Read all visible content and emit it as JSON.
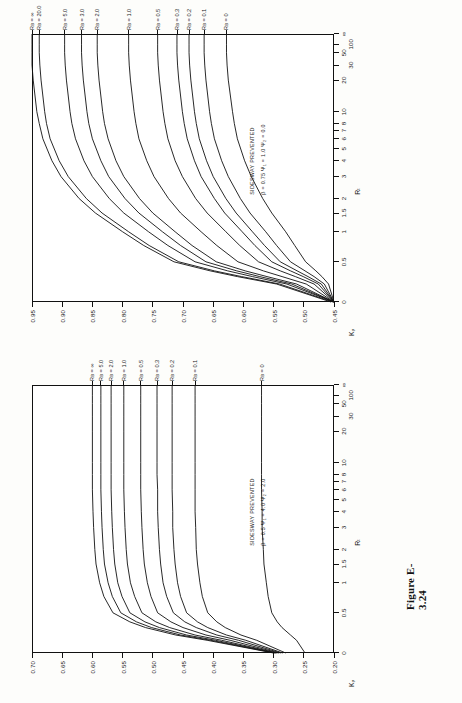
{
  "page": {
    "background": "#fdfdfb",
    "ink": "#111111"
  },
  "figures": [
    {
      "id": "figure-e-3-24",
      "caption": "Figure E-3.24",
      "position": "top",
      "annotation_line1": "SIDESWAY PREVENTED",
      "annotation_line2": "β = 0.75   Ψ₁ = 1.0    Ψ₂ = 0.0",
      "y_axis_title": "Kᵧ",
      "x_axis_title": "Rₜ",
      "y_ticks": [
        "0.45",
        "0.50",
        "0.55",
        "0.60",
        "0.65",
        "0.70",
        "0.75",
        "0.80",
        "0.85",
        "0.90",
        "0.95"
      ],
      "x_ticks": [
        "0",
        "0.5",
        "1",
        "1.5",
        "2",
        "3",
        "4",
        "5",
        "6",
        "7",
        "8",
        "10",
        "20",
        "30",
        "50",
        "100",
        "∞"
      ],
      "x_major_labels": [
        "0",
        "0.5",
        "1",
        "1.5",
        "2",
        "3",
        "4",
        "5",
        "6",
        "7",
        "8",
        "10",
        "20",
        "30",
        "50",
        "100",
        "∞"
      ],
      "curve_labels": [
        "Rʙ = ∞",
        "Rʙ = 20.0",
        "Rʙ = 5.0",
        "Rʙ = 3.0",
        "Rʙ = 2.0",
        "Rʙ = 1.0",
        "Rʙ = 0.5",
        "Rʙ = 0.3",
        "Rʙ = 0.2",
        "Rʙ = 0.1",
        "Rʙ = 0"
      ]
    },
    {
      "id": "figure-e-3-23",
      "caption": "Figure E-3.23",
      "position": "bottom",
      "annotation_line1": "SIDESWAY PREVENTED",
      "annotation_line2": "β = 0.5  Ψ₁ = 4.0   Ψ₂ = 2.0",
      "y_axis_title": "Kᵧ",
      "x_axis_title": "Rₜ",
      "y_ticks": [
        "0.20",
        "0.25",
        "0.30",
        "0.35",
        "0.40",
        "0.45",
        "0.50",
        "0.55",
        "0.60",
        "0.65",
        "0.70"
      ],
      "x_ticks": [
        "0",
        "0.5",
        "1",
        "1.5",
        "2",
        "3",
        "4",
        "5",
        "6",
        "7",
        "8",
        "10",
        "20",
        "30",
        "50",
        "100",
        "∞"
      ],
      "x_major_labels": [
        "0",
        "0.5",
        "1",
        "1.5",
        "2",
        "3",
        "4",
        "5",
        "6",
        "7",
        "8",
        "10",
        "20",
        "30",
        "50",
        "100",
        "∞"
      ],
      "curve_labels": [
        "Rʙ = ∞",
        "Rʙ = 5.0",
        "Rʙ = 2.0",
        "Rʙ = 1.0",
        "Rʙ = 0.5",
        "Rʙ = 0.3",
        "Rʙ = 0.2",
        "Rʙ = 0.1",
        "Rʙ = 0"
      ]
    }
  ],
  "chart_data": [
    {
      "type": "line",
      "title": "Figure E-3.24",
      "xlabel": "R_T",
      "ylabel": "K_y",
      "xscale": "log-ish (0 to infinity, compressed)",
      "ylim": [
        0.45,
        0.95
      ],
      "xlim": [
        0,
        100
      ],
      "grid": false,
      "legend": "curve end labels at top of plot",
      "annotations": [
        "SIDESWAY PREVENTED",
        "β = 0.75   Ψ₁ = 1.0    Ψ₂ = 0.0"
      ],
      "x": [
        0,
        0.1,
        0.2,
        0.3,
        0.5,
        0.75,
        1,
        1.5,
        2,
        3,
        4,
        6,
        8,
        10,
        20,
        30,
        50,
        100
      ],
      "series": [
        {
          "name": "R_B = ∞",
          "values": [
            0.455,
            0.545,
            0.61,
            0.655,
            0.715,
            0.765,
            0.8,
            0.845,
            0.872,
            0.902,
            0.917,
            0.932,
            0.938,
            0.942,
            0.948,
            0.95,
            0.95,
            0.95
          ]
        },
        {
          "name": "R_B = 20.0",
          "values": [
            0.452,
            0.54,
            0.603,
            0.648,
            0.707,
            0.756,
            0.79,
            0.834,
            0.86,
            0.89,
            0.905,
            0.92,
            0.926,
            0.929,
            0.935,
            0.937,
            0.938,
            0.938
          ]
        },
        {
          "name": "R_B = 5.0",
          "values": [
            0.45,
            0.528,
            0.585,
            0.626,
            0.68,
            0.725,
            0.757,
            0.798,
            0.822,
            0.85,
            0.864,
            0.878,
            0.884,
            0.887,
            0.893,
            0.895,
            0.896,
            0.896
          ]
        },
        {
          "name": "R_B = 3.0",
          "values": [
            0.45,
            0.52,
            0.573,
            0.611,
            0.662,
            0.704,
            0.734,
            0.773,
            0.796,
            0.823,
            0.836,
            0.85,
            0.856,
            0.859,
            0.865,
            0.867,
            0.868,
            0.868
          ]
        },
        {
          "name": "R_B = 2.0",
          "values": [
            0.45,
            0.512,
            0.561,
            0.597,
            0.645,
            0.685,
            0.713,
            0.75,
            0.772,
            0.798,
            0.811,
            0.824,
            0.83,
            0.833,
            0.839,
            0.841,
            0.842,
            0.842
          ]
        },
        {
          "name": "R_B = 1.0",
          "values": [
            0.45,
            0.496,
            0.536,
            0.567,
            0.609,
            0.644,
            0.67,
            0.704,
            0.724,
            0.748,
            0.76,
            0.773,
            0.778,
            0.781,
            0.787,
            0.789,
            0.79,
            0.79
          ]
        },
        {
          "name": "R_B = 0.5",
          "values": [
            0.45,
            0.483,
            0.514,
            0.539,
            0.575,
            0.606,
            0.629,
            0.66,
            0.679,
            0.701,
            0.713,
            0.725,
            0.73,
            0.733,
            0.739,
            0.741,
            0.742,
            0.742
          ]
        },
        {
          "name": "R_B = 0.3",
          "values": [
            0.45,
            0.476,
            0.501,
            0.522,
            0.553,
            0.581,
            0.602,
            0.631,
            0.648,
            0.67,
            0.681,
            0.693,
            0.698,
            0.701,
            0.707,
            0.709,
            0.71,
            0.71
          ]
        },
        {
          "name": "R_B = 0.2",
          "values": [
            0.45,
            0.471,
            0.493,
            0.511,
            0.539,
            0.565,
            0.585,
            0.612,
            0.629,
            0.65,
            0.661,
            0.673,
            0.678,
            0.681,
            0.687,
            0.689,
            0.69,
            0.69
          ]
        },
        {
          "name": "R_B = 0.1",
          "values": [
            0.45,
            0.466,
            0.483,
            0.498,
            0.522,
            0.545,
            0.563,
            0.589,
            0.605,
            0.625,
            0.636,
            0.648,
            0.653,
            0.656,
            0.662,
            0.664,
            0.665,
            0.665
          ]
        },
        {
          "name": "R_B = 0",
          "values": [
            0.45,
            0.459,
            0.47,
            0.48,
            0.497,
            0.515,
            0.53,
            0.553,
            0.568,
            0.587,
            0.598,
            0.61,
            0.615,
            0.618,
            0.625,
            0.627,
            0.628,
            0.628
          ]
        }
      ]
    },
    {
      "type": "line",
      "title": "Figure E-3.23",
      "xlabel": "R_T",
      "ylabel": "K_y",
      "xscale": "log-ish (0 to infinity, compressed)",
      "ylim": [
        0.2,
        0.7
      ],
      "xlim": [
        0,
        100
      ],
      "grid": false,
      "legend": "curve end labels at top of plot",
      "annotations": [
        "SIDESWAY PREVENTED",
        "β = 0.5  Ψ₁ = 4.0   Ψ₂ = 2.0"
      ],
      "x": [
        0,
        0.05,
        0.1,
        0.2,
        0.3,
        0.5,
        0.75,
        1,
        1.5,
        2,
        3,
        4,
        6,
        8,
        10,
        20,
        30,
        50,
        100
      ],
      "series": [
        {
          "name": "R_B = ∞",
          "values": [
            0.3,
            0.41,
            0.462,
            0.512,
            0.538,
            0.566,
            0.581,
            0.588,
            0.594,
            0.596,
            0.598,
            0.599,
            0.6,
            0.6,
            0.6,
            0.6,
            0.6,
            0.6,
            0.6
          ]
        },
        {
          "name": "R_B = 5.0",
          "values": [
            0.298,
            0.404,
            0.454,
            0.502,
            0.527,
            0.553,
            0.567,
            0.574,
            0.58,
            0.582,
            0.584,
            0.585,
            0.586,
            0.586,
            0.586,
            0.586,
            0.586,
            0.586,
            0.586
          ]
        },
        {
          "name": "R_B = 2.0",
          "values": [
            0.296,
            0.396,
            0.444,
            0.489,
            0.513,
            0.538,
            0.551,
            0.558,
            0.563,
            0.565,
            0.567,
            0.568,
            0.569,
            0.569,
            0.569,
            0.569,
            0.569,
            0.569,
            0.569
          ]
        },
        {
          "name": "R_B = 1.0",
          "values": [
            0.294,
            0.386,
            0.43,
            0.472,
            0.495,
            0.518,
            0.53,
            0.537,
            0.542,
            0.544,
            0.546,
            0.547,
            0.548,
            0.548,
            0.548,
            0.548,
            0.548,
            0.548,
            0.548
          ]
        },
        {
          "name": "R_B = 0.5",
          "values": [
            0.291,
            0.372,
            0.412,
            0.45,
            0.47,
            0.492,
            0.503,
            0.509,
            0.514,
            0.516,
            0.518,
            0.519,
            0.52,
            0.52,
            0.52,
            0.52,
            0.52,
            0.52,
            0.52
          ]
        },
        {
          "name": "R_B = 0.3",
          "values": [
            0.288,
            0.358,
            0.394,
            0.428,
            0.447,
            0.466,
            0.477,
            0.483,
            0.487,
            0.489,
            0.491,
            0.492,
            0.492,
            0.493,
            0.493,
            0.493,
            0.493,
            0.493,
            0.493
          ]
        },
        {
          "name": "R_B = 0.2",
          "values": [
            0.285,
            0.346,
            0.378,
            0.409,
            0.426,
            0.444,
            0.454,
            0.459,
            0.463,
            0.465,
            0.467,
            0.467,
            0.468,
            0.468,
            0.468,
            0.468,
            0.468,
            0.468,
            0.468
          ]
        },
        {
          "name": "R_B = 0.1",
          "values": [
            0.28,
            0.328,
            0.354,
            0.38,
            0.394,
            0.409,
            0.418,
            0.422,
            0.426,
            0.428,
            0.429,
            0.43,
            0.43,
            0.43,
            0.43,
            0.43,
            0.43,
            0.43,
            0.43
          ]
        },
        {
          "name": "R_B = 0",
          "values": [
            0.248,
            0.262,
            0.272,
            0.286,
            0.294,
            0.303,
            0.309,
            0.312,
            0.316,
            0.317,
            0.319,
            0.319,
            0.32,
            0.32,
            0.32,
            0.32,
            0.32,
            0.32,
            0.32
          ]
        }
      ]
    }
  ]
}
